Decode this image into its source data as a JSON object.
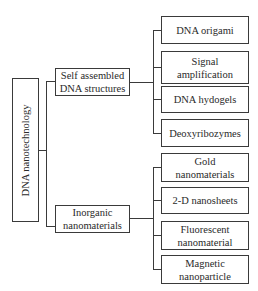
{
  "diagram": {
    "root": {
      "label": "DNA nanotechnology"
    },
    "branches": [
      {
        "label": "Self assembled DNA structures",
        "line1": "Self assembled",
        "line2": "DNA structures",
        "children": [
          {
            "line1": "DNA origami",
            "line2": ""
          },
          {
            "line1": "Signal",
            "line2": "amplification"
          },
          {
            "line1": "DNA hydogels",
            "line2": ""
          },
          {
            "line1": "Deoxyribozymes",
            "line2": ""
          }
        ]
      },
      {
        "label": "Inorganic nanomaterials",
        "line1": "Inorganic",
        "line2": "nanomaterials",
        "children": [
          {
            "line1": "Gold",
            "line2": "nanomaterials"
          },
          {
            "line1": "2-D nanosheets",
            "line2": ""
          },
          {
            "line1": "Fluorescent",
            "line2": "nanomaterial"
          },
          {
            "line1": "Magnetic",
            "line2": "nanoparticle"
          }
        ]
      }
    ]
  }
}
